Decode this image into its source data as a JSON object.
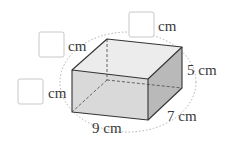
{
  "diagram": {
    "type": "cuboid-net-labels",
    "labels": {
      "height": "5 cm",
      "depth": "7 cm",
      "width": "9 cm",
      "blank_unit_top": "cm",
      "blank_unit_upper_left": "cm",
      "blank_unit_lower_left": "cm"
    },
    "colors": {
      "front_face": "#d9d9d9",
      "top_face": "#ececec",
      "right_face": "#b9b9b9",
      "edge": "#333333",
      "dashed_edge": "#555555",
      "ellipse": "#9a9a9a",
      "blank_box": "#c8c8c8"
    }
  }
}
